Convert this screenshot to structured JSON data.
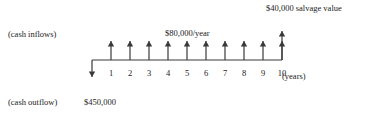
{
  "diagram": {
    "type": "cash-flow-timeline",
    "title_visible": false,
    "labels": {
      "salvage_value": "$40,000 salvage value",
      "cash_inflows": "(cash inflows)",
      "annual_inflow": "$80,000/year",
      "cash_outflow": "(cash outflow)",
      "initial_cost": "$450,000",
      "time_unit": "(years)"
    },
    "axis": {
      "tick_labels": [
        "1",
        "2",
        "3",
        "4",
        "5",
        "6",
        "7",
        "8",
        "9",
        "10"
      ],
      "origin_period": 0,
      "first_period": 1,
      "last_period": 10
    },
    "colors": {
      "background": "#ffffff",
      "line": "#3a3a3a",
      "text": "#222222"
    },
    "flows": {
      "outflow": {
        "period": 0,
        "amount": "$450,000",
        "direction": "down"
      },
      "inflows": {
        "periods": [
          1,
          2,
          3,
          4,
          5,
          6,
          7,
          8,
          9,
          10
        ],
        "amount_each": "$80,000/year",
        "direction": "up"
      },
      "salvage": {
        "period": 10,
        "amount": "$40,000 salvage value",
        "direction": "up"
      }
    }
  },
  "chart_data": {
    "type": "bar",
    "title": "",
    "xlabel": "(years)",
    "ylabel": "",
    "categories": [
      "0",
      "1",
      "2",
      "3",
      "4",
      "5",
      "6",
      "7",
      "8",
      "9",
      "10"
    ],
    "series": [
      {
        "name": "$80,000/year",
        "values": [
          0,
          80000,
          80000,
          80000,
          80000,
          80000,
          80000,
          80000,
          80000,
          80000,
          80000
        ]
      },
      {
        "name": "$40,000 salvage value",
        "values": [
          0,
          0,
          0,
          0,
          0,
          0,
          0,
          0,
          0,
          0,
          40000
        ]
      },
      {
        "name": "$450,000",
        "values": [
          -450000,
          0,
          0,
          0,
          0,
          0,
          0,
          0,
          0,
          0,
          0
        ]
      }
    ],
    "grid": false,
    "legend": "none"
  }
}
